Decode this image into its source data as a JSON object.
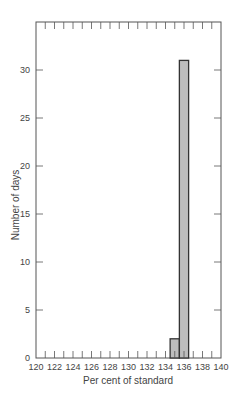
{
  "chart_data": {
    "type": "bar",
    "subtype": "histogram",
    "title": "",
    "xlabel": "Per cent of standard",
    "ylabel": "Number of days",
    "xlim": [
      120,
      140
    ],
    "ylim": [
      0,
      34
    ],
    "x_ticks": [
      120,
      122,
      124,
      126,
      128,
      130,
      132,
      134,
      136,
      138,
      140
    ],
    "y_ticks": [
      0,
      5,
      10,
      15,
      20,
      25,
      30
    ],
    "minor_x_ticks": [
      121,
      123,
      125,
      127,
      129,
      131,
      133,
      135,
      137,
      139
    ],
    "bins": [
      {
        "from": 134.5,
        "to": 135.5,
        "value": 2
      },
      {
        "from": 135.5,
        "to": 136.5,
        "value": 31
      }
    ],
    "categories": [
      "134.5-135.5",
      "135.5-136.5"
    ],
    "values": [
      2,
      31
    ],
    "grid": false,
    "legend": null,
    "colors": {
      "bar_fill": "#bdbdbd",
      "bar_stroke": "#333333",
      "axis": "#555555"
    }
  }
}
